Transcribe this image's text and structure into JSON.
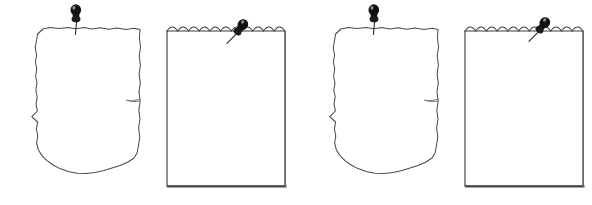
{
  "scene": {
    "title": "Pinned Paper Notes",
    "description": "Four blank pinned paper illustrations on a white background",
    "width": 592,
    "height": 205,
    "background_color": "#ffffff",
    "ink_color": "#3c3c3c",
    "pin_color": "#111111",
    "item_count": 4
  },
  "items": [
    {
      "index": 1,
      "type": "torn-paper",
      "label": "Torn edge paper sheet",
      "pin_style": "upright",
      "pin_label": "Push pin",
      "left": 14,
      "width": 132,
      "has_side_tear": true,
      "content": ""
    },
    {
      "index": 2,
      "type": "notepad-sheet",
      "label": "Notepad sheet with perforated top",
      "pin_style": "tilted",
      "pin_label": "Push pin",
      "left": 164,
      "width": 124,
      "scallop_count": 11,
      "content": ""
    },
    {
      "index": 3,
      "type": "torn-paper",
      "label": "Torn edge paper sheet",
      "pin_style": "upright",
      "pin_label": "Push pin",
      "left": 312,
      "width": 132,
      "has_side_tear": true,
      "content": ""
    },
    {
      "index": 4,
      "type": "notepad-sheet",
      "label": "Notepad sheet with perforated top",
      "pin_style": "tilted",
      "pin_label": "Push pin",
      "left": 462,
      "width": 124,
      "scallop_count": 11,
      "content": ""
    }
  ]
}
